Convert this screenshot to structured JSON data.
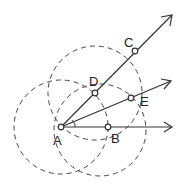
{
  "diagram": {
    "type": "geometric-construction",
    "points": [
      {
        "id": "A",
        "label": "A"
      },
      {
        "id": "B",
        "label": "B"
      },
      {
        "id": "C",
        "label": "C"
      },
      {
        "id": "D",
        "label": "D"
      },
      {
        "id": "E",
        "label": "E"
      }
    ],
    "rays": [
      {
        "id": "ray-AC",
        "from": "A",
        "through": "C"
      },
      {
        "id": "ray-AE",
        "from": "A",
        "through": "E"
      },
      {
        "id": "ray-AB",
        "from": "A",
        "through": "B"
      }
    ],
    "circles": [
      {
        "id": "circle-A",
        "center": "A",
        "style": "dashed"
      },
      {
        "id": "circle-D",
        "center": "D",
        "style": "dashed"
      },
      {
        "id": "circle-B",
        "center": "B",
        "style": "dashed"
      }
    ],
    "colors": {
      "stroke": "#333333",
      "background": "#ffffff"
    }
  }
}
